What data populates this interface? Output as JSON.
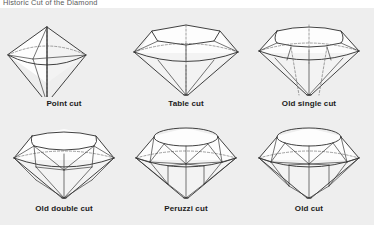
{
  "figure": {
    "title": "Historic Cut of the Diamond",
    "background_color": "#ffffff",
    "plate_color": "#eeeeee",
    "line_color": "#2b2b2b",
    "hidden_line_color": "#6e6e6e",
    "label_color": "#1b1b1b",
    "rows": 2,
    "columns": 3
  },
  "cuts": [
    {
      "id": "point-cut",
      "label": "Point cut",
      "row": 0,
      "column": 0
    },
    {
      "id": "table-cut",
      "label": "Table cut",
      "row": 0,
      "column": 1
    },
    {
      "id": "old-single-cut",
      "label": "Old single cut",
      "row": 0,
      "column": 2
    },
    {
      "id": "old-double-cut",
      "label": "Old double cut",
      "row": 1,
      "column": 0
    },
    {
      "id": "peruzzi-cut",
      "label": "Peruzzi cut",
      "row": 1,
      "column": 1
    },
    {
      "id": "old-cut",
      "label": "Old cut",
      "row": 1,
      "column": 2
    }
  ]
}
